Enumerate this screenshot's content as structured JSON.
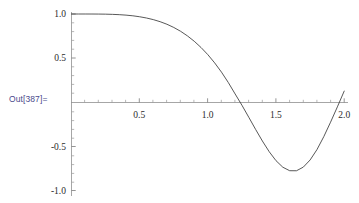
{
  "output_label": {
    "text": "Out[387]=",
    "color": "#4a4a8c"
  },
  "chart_data": {
    "type": "line",
    "title": "",
    "subtitle": "",
    "xlabel": "",
    "ylabel": "",
    "function": "cos(x^2)",
    "grid": false,
    "legend": null,
    "axis_color": "#8a8a8a",
    "curve_color": "#3a3a3a",
    "xlim": [
      0,
      2.0
    ],
    "ylim": [
      -1.0,
      1.0
    ],
    "xticks": [
      0.5,
      1.0,
      1.5,
      2.0
    ],
    "xtick_labels": [
      "0.5",
      "1.0",
      "1.5",
      "2.0"
    ],
    "yticks": [
      1.0,
      0.5,
      -0.5,
      -1.0
    ],
    "ytick_labels": [
      "1.0",
      "0.5",
      "-0.5",
      "-1.0"
    ],
    "x_minor_step": 0.1,
    "y_minor_step": 0.1,
    "series": [
      {
        "name": "cos(x^2)",
        "x": [
          0.0,
          0.05,
          0.1,
          0.15,
          0.2,
          0.25,
          0.3,
          0.35,
          0.4,
          0.45,
          0.5,
          0.55,
          0.6,
          0.65,
          0.7,
          0.75,
          0.8,
          0.85,
          0.9,
          0.95,
          1.0,
          1.05,
          1.1,
          1.15,
          1.2,
          1.25,
          1.3,
          1.35,
          1.4,
          1.45,
          1.5,
          1.55,
          1.6,
          1.65,
          1.7,
          1.75,
          1.8,
          1.85,
          1.9,
          1.95,
          2.0
        ],
        "y": [
          1.0,
          0.999997,
          0.99995,
          0.999747,
          0.9992,
          0.998047,
          0.995953,
          0.992509,
          0.987228,
          0.979547,
          0.968912,
          0.954685,
          0.936456,
          0.913089,
          0.884089,
          0.8481,
          0.804749,
          0.752839,
          0.692243,
          0.62161,
          0.540302,
          0.447693,
          0.342898,
          0.225622,
          0.096736,
          -0.031139,
          -0.166276,
          -0.303282,
          -0.435129,
          -0.5561,
          -0.657562,
          -0.731393,
          -0.77076,
          -0.771142,
          -0.73033,
          -0.649388,
          -0.532833,
          -0.386545,
          -0.22251,
          -0.049625,
          0.128844
        ]
      }
    ]
  }
}
